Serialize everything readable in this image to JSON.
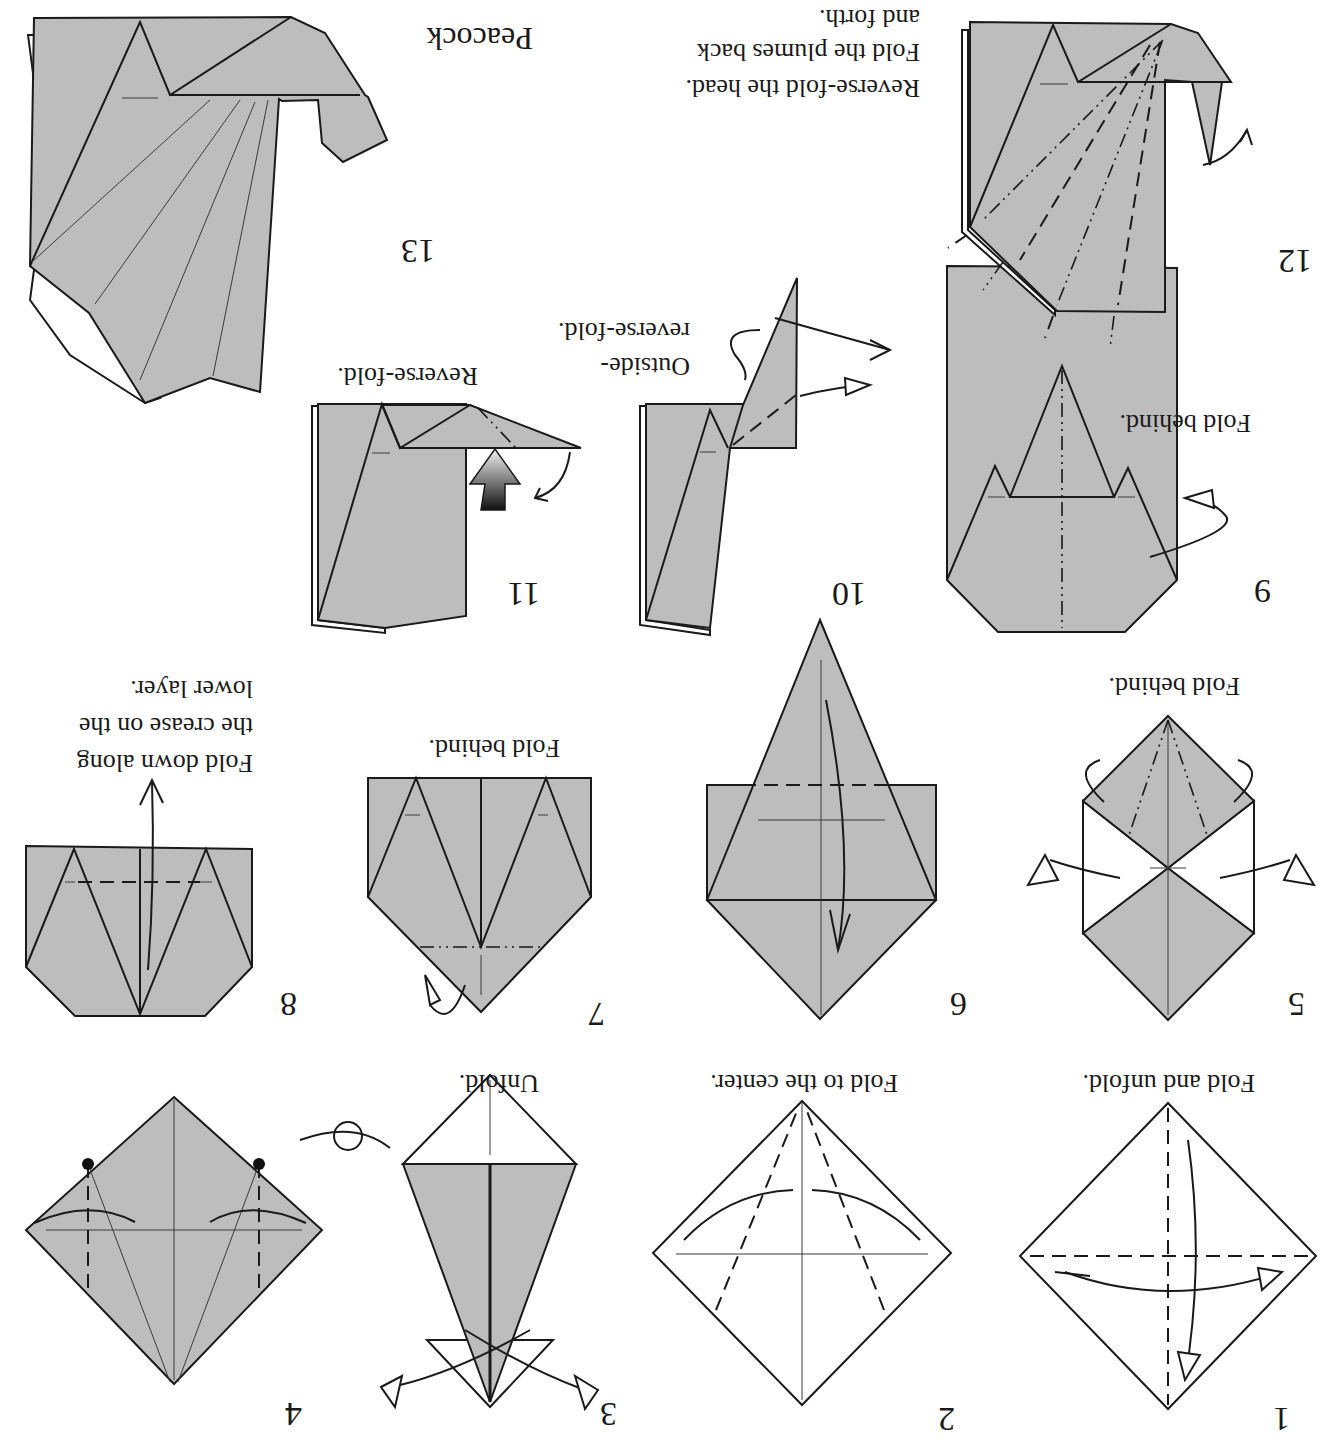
{
  "orientation": "rotated-180",
  "title": "Peacock",
  "colors": {
    "paper": "#bdbdbd",
    "line": "#1a1a1a",
    "background": "#ffffff"
  },
  "steps": [
    {
      "number": "1",
      "caption": [
        "Fold and unfold."
      ]
    },
    {
      "number": "2",
      "caption": [
        "Fold to the center."
      ]
    },
    {
      "number": "3",
      "caption": [
        "Unfold."
      ]
    },
    {
      "number": "4",
      "caption": [],
      "symbol": "turn-over-icon"
    },
    {
      "number": "5",
      "caption": [
        "Fold behind."
      ]
    },
    {
      "number": "6",
      "caption": []
    },
    {
      "number": "7",
      "caption": [
        "Fold behind."
      ]
    },
    {
      "number": "8",
      "caption": [
        "Fold down along",
        "the crease on the",
        "lower layer."
      ]
    },
    {
      "number": "9",
      "caption": [
        "Fold behind."
      ]
    },
    {
      "number": "10",
      "caption": [
        "Outside-",
        "reverse-fold."
      ]
    },
    {
      "number": "11",
      "caption": [
        "Reverse-fold."
      ],
      "symbol": "push-arrow-icon"
    },
    {
      "number": "12",
      "caption": [
        "Reverse-fold the head.",
        "Fold the plumes back",
        "and forth."
      ]
    },
    {
      "number": "13",
      "caption": []
    }
  ]
}
